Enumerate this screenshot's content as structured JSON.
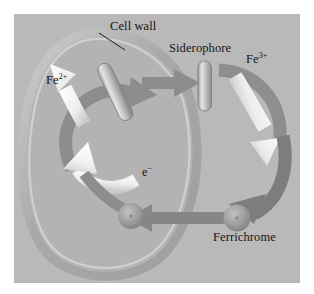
{
  "figure": {
    "background_color": "#ffffff",
    "panel_color": "#b9b9b9"
  },
  "labels": {
    "cell_wall": "Cell wall",
    "siderophore": "Siderophore",
    "ferric_ion": "Fe",
    "ferric_charge": "3+",
    "ferrous_ion": "Fe",
    "ferrous_charge": "2+",
    "electron": "e",
    "electron_charge": "−",
    "ferrichrome": "Ferrichrome"
  },
  "colors": {
    "panel": "#b9b9b9",
    "cell_interior": "#b2b2b2",
    "cell_wall_band": "#a0a0a0",
    "cell_wall_highlight": "#cfcfcf",
    "gray_arrow": "#8f8f8f",
    "dark_arrow": "#7e7e7e",
    "white_arrow": "#f2f2f2",
    "rod_body": "#a8a8a8",
    "rod_highlight": "#e2e2e2",
    "sphere": "#9b9b9b",
    "text": "#161616"
  },
  "elements": {
    "receptor_rod": "membrane receptor rod, tilted",
    "siderophore_rod": "free siderophore rod, vertical",
    "ferrichrome_sphere_outer": "ferrichrome complex outside cell",
    "ferrichrome_sphere_inner": "ferrichrome complex inside cell",
    "leader_line": "pointer from Cell wall label to cell envelope"
  }
}
